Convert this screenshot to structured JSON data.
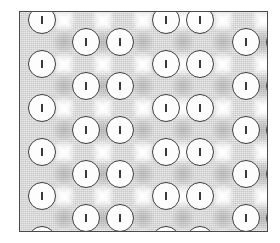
{
  "figure": {
    "kind": "patterned-texture-plate",
    "width": 280,
    "height": 243,
    "background_color": "#ffffff"
  },
  "plate": {
    "x": 19,
    "y": 11,
    "width": 249,
    "height": 221,
    "border_color": "#4a4a4a",
    "border_width": 1,
    "fill_color": "#d9d9d9"
  },
  "palette": {
    "ground": "#d9d9d9",
    "highlight": "#ffffff",
    "shadow": "#787878",
    "atom_fill": "#fdfdfd",
    "atom_stroke": "#3d3d3d",
    "tick": "#3a3a3a"
  },
  "lattice": {
    "description": "staggered column-pair lattice of ticked circles",
    "atom_diameter": 28,
    "column_x": [
      22,
      66,
      100,
      146,
      180,
      226,
      260
    ],
    "row_y_even": [
      30,
      74,
      118,
      162,
      206
    ],
    "row_y_odd": [
      8,
      52,
      96,
      140,
      184,
      228
    ],
    "tick_orientation": "vertical",
    "tick_length": 8
  },
  "atoms": [
    {
      "cx": 22,
      "cy": 8,
      "label": "atom"
    },
    {
      "cx": 66,
      "cy": 30,
      "label": "atom"
    },
    {
      "cx": 100,
      "cy": 30,
      "label": "atom"
    },
    {
      "cx": 146,
      "cy": 8,
      "label": "atom"
    },
    {
      "cx": 180,
      "cy": 8,
      "label": "atom"
    },
    {
      "cx": 226,
      "cy": 30,
      "label": "atom"
    },
    {
      "cx": 260,
      "cy": 30,
      "label": "atom"
    },
    {
      "cx": 22,
      "cy": 52,
      "label": "atom"
    },
    {
      "cx": 66,
      "cy": 74,
      "label": "atom"
    },
    {
      "cx": 100,
      "cy": 74,
      "label": "atom"
    },
    {
      "cx": 146,
      "cy": 52,
      "label": "atom"
    },
    {
      "cx": 180,
      "cy": 52,
      "label": "atom"
    },
    {
      "cx": 226,
      "cy": 74,
      "label": "atom"
    },
    {
      "cx": 260,
      "cy": 74,
      "label": "atom"
    },
    {
      "cx": 22,
      "cy": 96,
      "label": "atom"
    },
    {
      "cx": 66,
      "cy": 118,
      "label": "atom"
    },
    {
      "cx": 100,
      "cy": 118,
      "label": "atom"
    },
    {
      "cx": 146,
      "cy": 96,
      "label": "atom"
    },
    {
      "cx": 180,
      "cy": 96,
      "label": "atom"
    },
    {
      "cx": 226,
      "cy": 118,
      "label": "atom"
    },
    {
      "cx": 260,
      "cy": 118,
      "label": "atom"
    },
    {
      "cx": 22,
      "cy": 140,
      "label": "atom"
    },
    {
      "cx": 66,
      "cy": 162,
      "label": "atom"
    },
    {
      "cx": 100,
      "cy": 162,
      "label": "atom"
    },
    {
      "cx": 146,
      "cy": 140,
      "label": "atom"
    },
    {
      "cx": 180,
      "cy": 140,
      "label": "atom"
    },
    {
      "cx": 226,
      "cy": 162,
      "label": "atom"
    },
    {
      "cx": 260,
      "cy": 162,
      "label": "atom"
    },
    {
      "cx": 22,
      "cy": 184,
      "label": "atom"
    },
    {
      "cx": 66,
      "cy": 206,
      "label": "atom"
    },
    {
      "cx": 100,
      "cy": 206,
      "label": "atom"
    },
    {
      "cx": 146,
      "cy": 184,
      "label": "atom"
    },
    {
      "cx": 180,
      "cy": 184,
      "label": "atom"
    },
    {
      "cx": 226,
      "cy": 206,
      "label": "atom"
    },
    {
      "cx": 260,
      "cy": 206,
      "label": "atom"
    },
    {
      "cx": 22,
      "cy": 228,
      "label": "atom"
    },
    {
      "cx": 146,
      "cy": 228,
      "label": "atom"
    },
    {
      "cx": 180,
      "cy": 228,
      "label": "atom"
    }
  ],
  "stars": [
    {
      "cx": 44,
      "cy": 8
    },
    {
      "cx": 83,
      "cy": 8
    },
    {
      "cx": 123,
      "cy": 8
    },
    {
      "cx": 163,
      "cy": 8
    },
    {
      "cx": 203,
      "cy": 8
    },
    {
      "cx": 243,
      "cy": 8
    },
    {
      "cx": 44,
      "cy": 52
    },
    {
      "cx": 83,
      "cy": 52
    },
    {
      "cx": 123,
      "cy": 52
    },
    {
      "cx": 163,
      "cy": 52
    },
    {
      "cx": 203,
      "cy": 52
    },
    {
      "cx": 243,
      "cy": 52
    },
    {
      "cx": 44,
      "cy": 96
    },
    {
      "cx": 83,
      "cy": 96
    },
    {
      "cx": 123,
      "cy": 96
    },
    {
      "cx": 163,
      "cy": 96
    },
    {
      "cx": 203,
      "cy": 96
    },
    {
      "cx": 243,
      "cy": 96
    },
    {
      "cx": 44,
      "cy": 140
    },
    {
      "cx": 83,
      "cy": 140
    },
    {
      "cx": 123,
      "cy": 140
    },
    {
      "cx": 163,
      "cy": 140
    },
    {
      "cx": 203,
      "cy": 140
    },
    {
      "cx": 243,
      "cy": 140
    },
    {
      "cx": 44,
      "cy": 184
    },
    {
      "cx": 83,
      "cy": 184
    },
    {
      "cx": 123,
      "cy": 184
    },
    {
      "cx": 163,
      "cy": 184
    },
    {
      "cx": 203,
      "cy": 184
    },
    {
      "cx": 243,
      "cy": 184
    },
    {
      "cx": 44,
      "cy": 228
    },
    {
      "cx": 83,
      "cy": 228
    },
    {
      "cx": 123,
      "cy": 228
    },
    {
      "cx": 163,
      "cy": 228
    },
    {
      "cx": 203,
      "cy": 228
    },
    {
      "cx": 243,
      "cy": 228
    }
  ],
  "lobes": [
    {
      "cx": 44,
      "cy": 30
    },
    {
      "cx": 123,
      "cy": 30
    },
    {
      "cx": 203,
      "cy": 30
    },
    {
      "cx": 44,
      "cy": 74
    },
    {
      "cx": 123,
      "cy": 74
    },
    {
      "cx": 203,
      "cy": 74
    },
    {
      "cx": 44,
      "cy": 118
    },
    {
      "cx": 123,
      "cy": 118
    },
    {
      "cx": 203,
      "cy": 118
    },
    {
      "cx": 44,
      "cy": 162
    },
    {
      "cx": 123,
      "cy": 162
    },
    {
      "cx": 203,
      "cy": 162
    },
    {
      "cx": 44,
      "cy": 206
    },
    {
      "cx": 123,
      "cy": 206
    },
    {
      "cx": 203,
      "cy": 206
    },
    {
      "cx": 83,
      "cy": 30
    },
    {
      "cx": 163,
      "cy": 30
    },
    {
      "cx": 243,
      "cy": 30
    },
    {
      "cx": 83,
      "cy": 74
    },
    {
      "cx": 163,
      "cy": 74
    },
    {
      "cx": 243,
      "cy": 74
    },
    {
      "cx": 83,
      "cy": 118
    },
    {
      "cx": 163,
      "cy": 118
    },
    {
      "cx": 243,
      "cy": 118
    },
    {
      "cx": 83,
      "cy": 162
    },
    {
      "cx": 163,
      "cy": 162
    },
    {
      "cx": 243,
      "cy": 162
    },
    {
      "cx": 83,
      "cy": 206
    },
    {
      "cx": 163,
      "cy": 206
    },
    {
      "cx": 243,
      "cy": 206
    }
  ]
}
